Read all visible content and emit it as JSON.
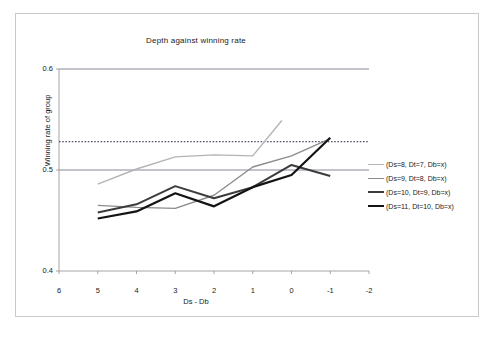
{
  "chart_data": {
    "type": "line",
    "title": "Depth against winning rate",
    "xlabel": "Ds - Db",
    "ylabel": "Winning rate of group",
    "x": [
      5,
      4,
      3,
      2,
      1,
      0,
      -1
    ],
    "xticks": [
      "6",
      "5",
      "4",
      "3",
      "2",
      "1",
      "0",
      "-1",
      "-2"
    ],
    "xlim": [
      6,
      -2
    ],
    "yticks": [
      "0.4",
      "0.5",
      "0.6"
    ],
    "ylim": [
      0.4,
      0.6
    ],
    "grid": true,
    "gridlines": [
      0.5,
      0.6
    ],
    "reference_line": {
      "value": 0.528,
      "style": "dotted"
    },
    "legend_position": "right",
    "series": [
      {
        "name": "(Ds=8, Dt=7, Db=x)",
        "color": "#b4b4b4",
        "width": 1.4,
        "x": [
          5,
          4,
          3,
          2,
          1,
          0.25
        ],
        "values": [
          0.486,
          0.501,
          0.513,
          0.515,
          0.514,
          0.549
        ]
      },
      {
        "name": "(Ds=9, Dt=8, Db=x)",
        "color": "#8c8c8c",
        "width": 1.4,
        "x": [
          5,
          4,
          3,
          2,
          1,
          0,
          -1
        ],
        "values": [
          0.465,
          0.463,
          0.462,
          0.475,
          0.503,
          0.514,
          0.531
        ]
      },
      {
        "name": "(Ds=10, Dt=9, Db=x)",
        "color": "#3c3c3c",
        "width": 2.0,
        "x": [
          5,
          4,
          3,
          2,
          1,
          0,
          -1
        ],
        "values": [
          0.458,
          0.466,
          0.484,
          0.472,
          0.483,
          0.505,
          0.494
        ]
      },
      {
        "name": "(Ds=11, Dt=10, Db=x)",
        "color": "#141414",
        "width": 2.2,
        "x": [
          5,
          4,
          3,
          2,
          1,
          0,
          -1
        ],
        "values": [
          0.452,
          0.459,
          0.477,
          0.464,
          0.483,
          0.495,
          0.532
        ]
      }
    ]
  },
  "legend": {
    "items": [
      {
        "label": "(Ds=8, Dt=7, Db=x)"
      },
      {
        "label": "(Ds=9, Dt=8, Db=x)"
      },
      {
        "label": "(Ds=10, Dt=9, Db=x)"
      },
      {
        "label": "(Ds=11, Dt=10, Db=x)"
      }
    ]
  }
}
